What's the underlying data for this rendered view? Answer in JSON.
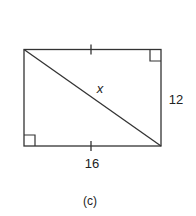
{
  "figure": {
    "caption": "(c)",
    "shape": "rectangle",
    "labels": {
      "diagonal": "x",
      "right_side": "12",
      "bottom_side": "16"
    },
    "markings": {
      "congruence_ticks": [
        "top-side",
        "bottom-side"
      ],
      "right_angles": [
        "top-right",
        "bottom-left"
      ]
    },
    "colors": {
      "stroke": "#333333",
      "background": "#ffffff"
    }
  }
}
